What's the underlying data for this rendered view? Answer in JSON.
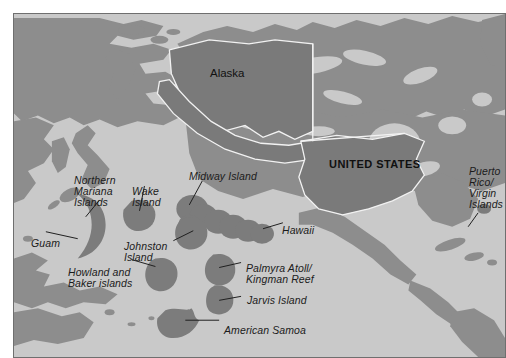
{
  "map": {
    "title": "Map of United States and its Pacific and Caribbean territories",
    "colors": {
      "ocean": "#c9c9c9",
      "land": "#8d8d8d",
      "us_highlight": "#7a7a7a",
      "island_marker": "#7c7c7c",
      "highlight_outline": "#f2f2f2",
      "frame": "#6f6f6f",
      "label_text": "#1b1b1b",
      "leader_line": "#1f1f1f",
      "page_background": "#ffffff"
    },
    "country_labels": [
      {
        "id": "alaska",
        "text": "Alaska",
        "style": "upright"
      },
      {
        "id": "united-states",
        "text": "UNITED STATES",
        "style": "upright-bold-caps"
      }
    ],
    "territory_labels": [
      {
        "id": "northern-mariana-islands",
        "text": "Northern\nMariana\nIslands",
        "style": "italic",
        "has_leader": true
      },
      {
        "id": "wake-island",
        "text": "Wake\nIsland",
        "style": "italic",
        "has_leader": true
      },
      {
        "id": "midway-island",
        "text": "Midway Island",
        "style": "italic",
        "has_leader": true
      },
      {
        "id": "guam",
        "text": "Guam",
        "style": "italic",
        "has_leader": true
      },
      {
        "id": "johnston-island",
        "text": "Johnston\nIsland",
        "style": "italic",
        "has_leader": true
      },
      {
        "id": "howland-and-baker-islands",
        "text": "Howland and\nBaker islands",
        "style": "italic",
        "has_leader": true
      },
      {
        "id": "hawaii",
        "text": "Hawaii",
        "style": "italic",
        "has_leader": true
      },
      {
        "id": "palmyra-atoll-kingman-reef",
        "text": "Palmyra Atoll/\nKingman Reef",
        "style": "italic",
        "has_leader": true
      },
      {
        "id": "jarvis-island",
        "text": "Jarvis Island",
        "style": "italic",
        "has_leader": true
      },
      {
        "id": "american-samoa",
        "text": "American Samoa",
        "style": "italic",
        "has_leader": true
      },
      {
        "id": "puerto-rico-virgin-islands",
        "text": "Puerto\nRico/\nVirgin\nIslands",
        "style": "italic",
        "has_leader": true
      }
    ]
  }
}
